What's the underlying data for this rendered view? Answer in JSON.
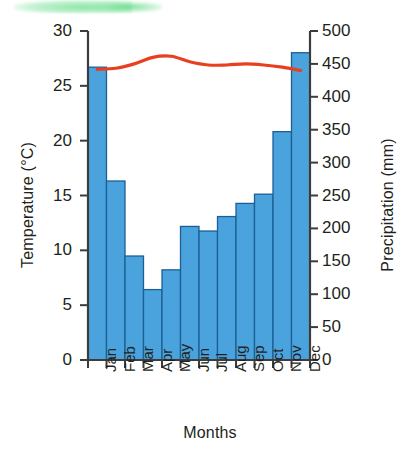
{
  "chart_data": {
    "type": "bar",
    "title": "",
    "subtitle": "",
    "xlabel": "Months",
    "ylabel": "Temperature (°C)",
    "y2label": "Precipitation (mm)",
    "categories": [
      "Jan",
      "Feb",
      "Mar",
      "Apr",
      "May",
      "Jun",
      "Jul",
      "Aug",
      "Sep",
      "Oct",
      "Nov",
      "Dec"
    ],
    "ylim": [
      0,
      30
    ],
    "yticks": [
      0,
      5,
      10,
      15,
      20,
      25,
      30
    ],
    "y2lim": [
      0,
      500
    ],
    "y2ticks": [
      0,
      50,
      100,
      150,
      200,
      250,
      300,
      350,
      400,
      450,
      500
    ],
    "grid": false,
    "legend": "none",
    "series": [
      {
        "name": "Precipitation",
        "kind": "bar",
        "axis": "right",
        "unit": "mm",
        "color": "#4aa3dc",
        "edge_color": "#1b5f96",
        "values": [
          445,
          272,
          158,
          107,
          137,
          203,
          196,
          218,
          238,
          252,
          347,
          467
        ]
      },
      {
        "name": "Temperature",
        "kind": "line",
        "axis": "left",
        "unit": "°C",
        "color": "#e8401f",
        "values": [
          26.5,
          26.6,
          27.0,
          27.6,
          27.7,
          27.2,
          26.9,
          26.9,
          27.0,
          26.9,
          26.7,
          26.4
        ]
      }
    ]
  },
  "axes": {
    "left_tick_labels": [
      "30",
      "25",
      "20",
      "15",
      "10",
      "5",
      "0"
    ],
    "right_tick_labels": [
      "500",
      "450",
      "400",
      "350",
      "300",
      "250",
      "200",
      "150",
      "100",
      "50",
      "0"
    ],
    "left_title": "Temperature (°C)",
    "right_title": "Precipitation (mm)",
    "bottom_title": "Months",
    "month_labels": [
      "Jan",
      "Feb",
      "Mar",
      "Apr",
      "May",
      "Jun",
      "Jul",
      "Aug",
      "Sep",
      "Oct",
      "Nov",
      "Dec"
    ]
  },
  "colors": {
    "bar_fill": "#4aa3dc",
    "bar_edge": "#1b5f96",
    "temperature_line": "#e8401f",
    "axis": "#3c3c3c",
    "text": "#231f20",
    "background": "#ffffff",
    "scan_highlight": "#7ae296"
  }
}
